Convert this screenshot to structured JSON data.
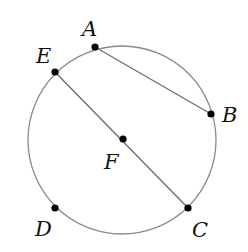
{
  "diagram": {
    "type": "circle-geometry",
    "circle": {
      "cx": 122,
      "cy": 140,
      "r": 94,
      "stroke": "#8a8a8a"
    },
    "segment_color": "#6e6e6e",
    "point_color": "#000000",
    "points": [
      {
        "id": "A",
        "label": "A",
        "x": 95,
        "y": 47,
        "lx": 82,
        "ly": 36
      },
      {
        "id": "B",
        "label": "B",
        "x": 211,
        "y": 114,
        "lx": 222,
        "ly": 122
      },
      {
        "id": "C",
        "label": "C",
        "x": 188,
        "y": 208,
        "lx": 192,
        "ly": 237
      },
      {
        "id": "D",
        "label": "D",
        "x": 55,
        "y": 208,
        "lx": 35,
        "ly": 236
      },
      {
        "id": "E",
        "label": "E",
        "x": 55,
        "y": 72,
        "lx": 36,
        "ly": 63
      },
      {
        "id": "F",
        "label": "F",
        "x": 123,
        "y": 139,
        "lx": 104,
        "ly": 169
      }
    ],
    "segments": [
      {
        "from": "A",
        "to": "B",
        "label": "AB"
      },
      {
        "from": "E",
        "to": "C",
        "label": "EC"
      }
    ]
  }
}
